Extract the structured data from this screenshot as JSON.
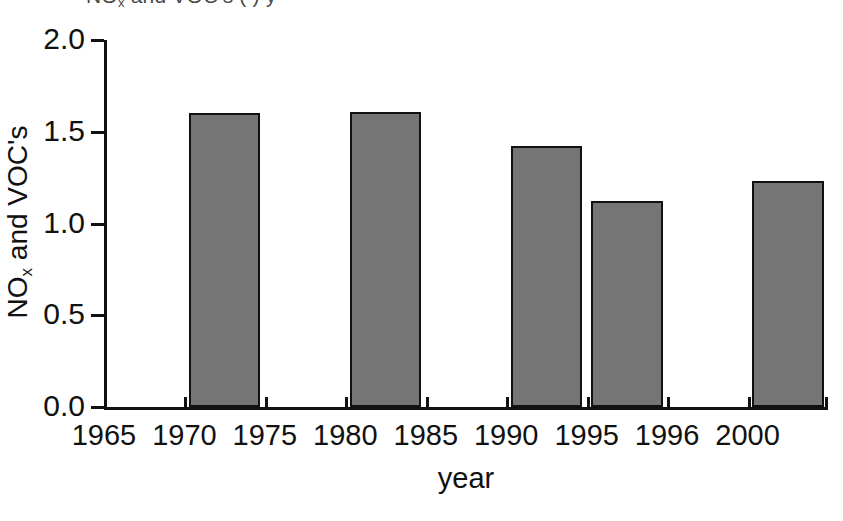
{
  "chart_data": {
    "type": "bar",
    "title_visible_text": "NO",
    "title_sub": "x",
    "title_rest": " and VOC's (           ) y",
    "xlabel": "year",
    "ylabel_main": "NO",
    "ylabel_sub": "x",
    "ylabel_rest": " and VOC's",
    "categories": [
      "1965",
      "1970",
      "1975",
      "1980",
      "1985",
      "1990",
      "1995",
      "1996",
      "2000"
    ],
    "values": [
      null,
      1.6,
      null,
      1.61,
      null,
      1.42,
      1.12,
      null,
      1.23
    ],
    "ylim": [
      0.0,
      2.0
    ],
    "ytick_values": [
      0.0,
      0.5,
      1.0,
      1.5,
      2.0
    ],
    "ytick_labels": [
      "0.0",
      "0.5",
      "1.0",
      "1.5",
      "2.0"
    ],
    "grid": false,
    "legend": null,
    "bar_color": "#757575",
    "bar_edge_color": "#111111",
    "axis_color": "#111111",
    "background": "#ffffff"
  }
}
